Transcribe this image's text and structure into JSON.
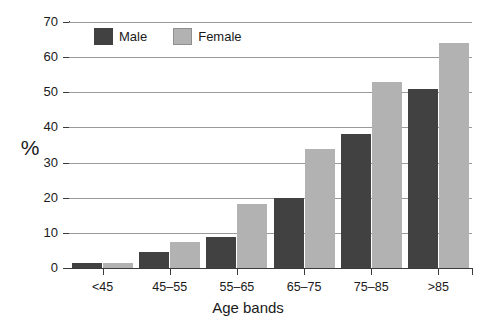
{
  "chart_data": {
    "type": "bar",
    "title": "",
    "xlabel": "Age bands",
    "ylabel": "%",
    "categories": [
      "<45",
      "45–55",
      "55–65",
      "65–75",
      "75–85",
      ">85"
    ],
    "series": [
      {
        "name": "Male",
        "color": "#414141",
        "values": [
          1.5,
          4.5,
          8.8,
          20,
          38,
          51
        ]
      },
      {
        "name": "Female",
        "color": "#b2b2b2",
        "values": [
          1.5,
          7.3,
          18.3,
          34,
          53,
          64
        ]
      }
    ],
    "ylim": [
      0,
      70
    ],
    "ytick_step": 10,
    "ytick_labels": [
      "0",
      "10",
      "20",
      "30",
      "40",
      "50",
      "60",
      "70"
    ],
    "grid": true,
    "grid_axis": "y",
    "legend_position": "top-left-inside"
  },
  "axes": {
    "y_title": "%",
    "x_title": "Age bands"
  },
  "legend": {
    "items": [
      {
        "label": "Male"
      },
      {
        "label": "Female"
      }
    ]
  },
  "colors": {
    "male": "#414141",
    "female": "#b2b2b2",
    "gridline": "#9a9a9a",
    "axis": "#3a3a3a",
    "background": "#ffffff",
    "text": "#1a1a1a"
  }
}
